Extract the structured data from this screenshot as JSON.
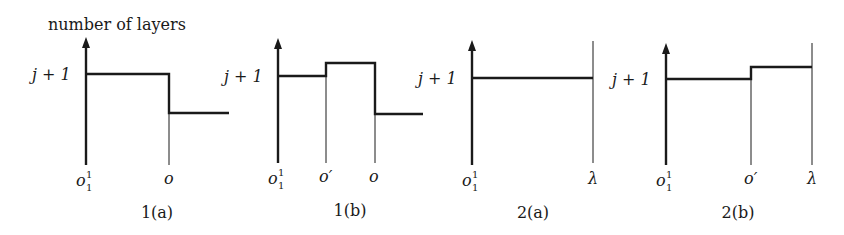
{
  "figure": {
    "y_axis_title": "number of layers",
    "level_label": "j + 1",
    "panels": [
      {
        "id": "1a",
        "caption": "1(a)",
        "x_ticks": [
          {
            "base": "o",
            "sup": "1",
            "sub": "1"
          },
          {
            "base": "o",
            "sup": "",
            "sub": ""
          }
        ],
        "profile": "level j+1 from o_1^1 to o, then drops lower after o"
      },
      {
        "id": "1b",
        "caption": "1(b)",
        "x_ticks": [
          {
            "base": "o",
            "sup": "1",
            "sub": "1"
          },
          {
            "base": "o′",
            "sup": "",
            "sub": ""
          },
          {
            "base": "o",
            "sup": "",
            "sub": ""
          }
        ],
        "profile": "level j+1 to o', rises between o' and o, drops lower after o"
      },
      {
        "id": "2a",
        "caption": "2(a)",
        "x_ticks": [
          {
            "base": "o",
            "sup": "1",
            "sub": "1"
          },
          {
            "base": "λ",
            "sup": "",
            "sub": ""
          }
        ],
        "profile": "level j+1 constant from o_1^1 to λ"
      },
      {
        "id": "2b",
        "caption": "2(b)",
        "x_ticks": [
          {
            "base": "o",
            "sup": "1",
            "sub": "1"
          },
          {
            "base": "o′",
            "sup": "",
            "sub": ""
          },
          {
            "base": "λ",
            "sup": "",
            "sub": ""
          }
        ],
        "profile": "level j+1 to o', rises slightly from o' to λ"
      }
    ],
    "colors": {
      "line": "#1a1a1a",
      "background": "#ffffff"
    }
  }
}
